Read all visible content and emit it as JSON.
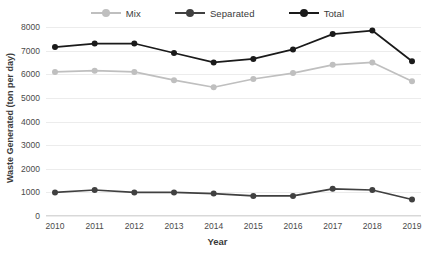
{
  "chart_data": {
    "type": "line",
    "title": "",
    "xlabel": "Year",
    "ylabel": "Waste Generated (ton per day)",
    "categories": [
      "2010",
      "2011",
      "2012",
      "2013",
      "2014",
      "2015",
      "2016",
      "2017",
      "2018",
      "2019"
    ],
    "ylim": [
      0,
      8000
    ],
    "yticks": [
      "0",
      "1000",
      "2000",
      "3000",
      "4000",
      "5000",
      "6000",
      "7000",
      "8000"
    ],
    "grid": true,
    "legend_position": "top-center",
    "series": [
      {
        "name": "Mix",
        "color": "#bfbfbf",
        "values": [
          6100,
          6150,
          6100,
          5750,
          5450,
          5800,
          6050,
          6400,
          6500,
          5700
        ]
      },
      {
        "name": "Separated",
        "color": "#404040",
        "values": [
          1000,
          1100,
          1000,
          1000,
          950,
          850,
          850,
          1150,
          1100,
          700
        ]
      },
      {
        "name": "Total",
        "color": "#1a1a1a",
        "values": [
          7150,
          7300,
          7300,
          6900,
          6500,
          6650,
          7050,
          7700,
          7850,
          6550
        ]
      }
    ]
  }
}
